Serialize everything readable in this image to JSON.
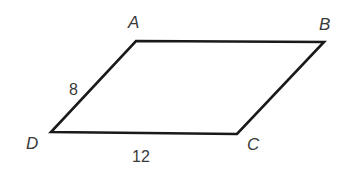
{
  "figure": {
    "type": "parallelogram",
    "vertices": {
      "A": {
        "label": "A",
        "x": 136,
        "y": 41
      },
      "B": {
        "label": "B",
        "x": 324,
        "y": 42
      },
      "C": {
        "label": "C",
        "x": 237,
        "y": 134
      },
      "D": {
        "label": "D",
        "x": 51,
        "y": 132
      }
    },
    "side_lengths": {
      "AD": "8",
      "DC": "12"
    },
    "stroke_color": "#1a1a1a",
    "label_color": "#3a3a3a"
  }
}
